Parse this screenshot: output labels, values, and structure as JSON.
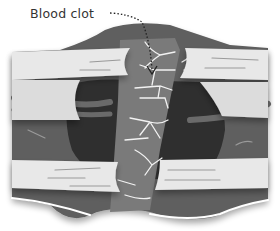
{
  "diagram": {
    "labels": [
      {
        "text": "Blood clot",
        "target": "clot-mesh"
      }
    ],
    "colors": {
      "tissue_dark": "#5e5e5e",
      "wound_darker": "#2f2f2f",
      "clot_band": "#7a7a7a",
      "skin_layer": "#e8e8e8",
      "vessel": "#6a6a6a",
      "fibrin": "#f2f2f2",
      "label_text": "#333333"
    }
  }
}
